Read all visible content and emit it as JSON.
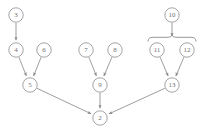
{
  "diagram": {
    "type": "directed-graph",
    "background_color": "#ffffff",
    "node_stroke_color": "#9a9a9a",
    "node_fill_color": "#ffffff",
    "edge_color": "#8d8d8d",
    "label_color": "#6f6f6f",
    "node_radius": 7.2,
    "nodes": [
      {
        "id": "n3",
        "label": "3",
        "x": 16,
        "y": 15
      },
      {
        "id": "n4",
        "label": "4",
        "x": 16,
        "y": 50
      },
      {
        "id": "n6",
        "label": "6",
        "x": 44,
        "y": 50
      },
      {
        "id": "n5",
        "label": "5",
        "x": 30,
        "y": 85
      },
      {
        "id": "n7",
        "label": "7",
        "x": 86,
        "y": 50
      },
      {
        "id": "n8",
        "label": "8",
        "x": 115,
        "y": 50
      },
      {
        "id": "n9",
        "label": "9",
        "x": 100,
        "y": 85
      },
      {
        "id": "n10",
        "label": "10",
        "x": 172,
        "y": 15
      },
      {
        "id": "n11",
        "label": "11",
        "x": 157,
        "y": 50
      },
      {
        "id": "n12",
        "label": "12",
        "x": 187,
        "y": 50
      },
      {
        "id": "n13",
        "label": "13",
        "x": 172,
        "y": 85
      },
      {
        "id": "n2",
        "label": "2",
        "x": 100,
        "y": 118
      }
    ],
    "edges": [
      {
        "id": "e-3-4",
        "from": "n3",
        "to": "n4",
        "arrow": true
      },
      {
        "id": "e-4-5",
        "from": "n4",
        "to": "n5",
        "arrow": true
      },
      {
        "id": "e-6-5",
        "from": "n6",
        "to": "n5",
        "arrow": true
      },
      {
        "id": "e-7-9",
        "from": "n7",
        "to": "n9",
        "arrow": true
      },
      {
        "id": "e-8-9",
        "from": "n8",
        "to": "n9",
        "arrow": true
      },
      {
        "id": "e-11-13",
        "from": "n11",
        "to": "n13",
        "arrow": true
      },
      {
        "id": "e-12-13",
        "from": "n12",
        "to": "n13",
        "arrow": true
      },
      {
        "id": "e-5-2",
        "from": "n5",
        "to": "n2",
        "arrow": true
      },
      {
        "id": "e-9-2",
        "from": "n9",
        "to": "n2",
        "arrow": true
      },
      {
        "id": "e-13-2",
        "from": "n13",
        "to": "n2",
        "arrow": true
      }
    ],
    "brace_edge": {
      "id": "e-10-brace",
      "from": "n10",
      "to_group": [
        "n11",
        "n12"
      ],
      "arrow": true,
      "description": "arrow from node 10 down into a horizontal curly brace spanning nodes 11 and 12"
    }
  }
}
